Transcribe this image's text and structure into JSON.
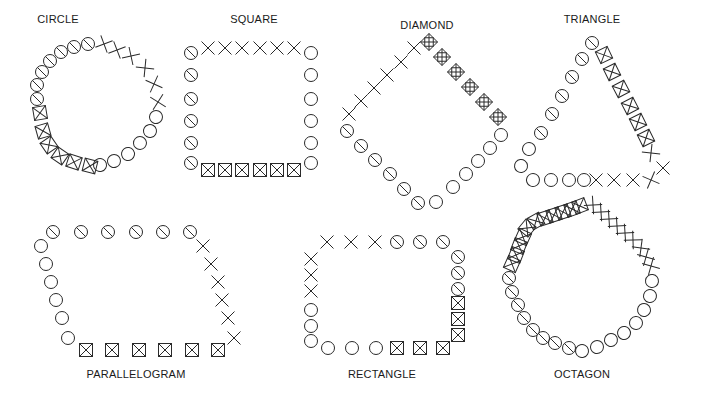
{
  "diagram": {
    "background": "#ffffff",
    "ink_color": "#2a2a2a",
    "symbol_legend": {
      "o": "open-circle",
      "s": "slashed-circle",
      "x": "x-cross",
      "b": "boxed-x",
      "d": "diamond-boxed-plus"
    },
    "shapes": [
      {
        "id": "circle",
        "label": "CIRCLE",
        "label_pos": [
          58,
          21
        ],
        "segments": [
          {
            "symbol": "s",
            "points": [
              [
                37,
                99
              ],
              [
                37,
                85
              ],
              [
                42,
                72
              ],
              [
                50,
                61
              ],
              [
                61,
                52
              ],
              [
                74,
                47
              ],
              [
                88,
                44
              ]
            ]
          },
          {
            "symbol": "x",
            "points": [
              [
                104,
                44
              ],
              [
                117,
                50
              ],
              [
                131,
                56
              ],
              [
                145,
                68
              ],
              [
                154,
                84
              ],
              [
                158,
                102
              ]
            ]
          },
          {
            "symbol": "o",
            "points": [
              [
                156,
                117
              ],
              [
                150,
                131
              ],
              [
                140,
                143
              ],
              [
                128,
                154
              ],
              [
                114,
                161
              ],
              [
                100,
                165
              ]
            ]
          },
          {
            "symbol": "b",
            "points": [
              [
                90,
                166
              ],
              [
                74,
                162
              ],
              [
                60,
                156
              ],
              [
                49,
                145
              ],
              [
                43,
                131
              ],
              [
                40,
                113
              ]
            ]
          }
        ]
      },
      {
        "id": "square",
        "label": "SQUARE",
        "label_pos": [
          254,
          21
        ],
        "segments": [
          {
            "symbol": "s",
            "points": [
              [
                191,
                53
              ],
              [
                191,
                75
              ],
              [
                191,
                99
              ],
              [
                191,
                121
              ],
              [
                191,
                143
              ],
              [
                191,
                163
              ]
            ]
          },
          {
            "symbol": "x",
            "points": [
              [
                208,
                48
              ],
              [
                225,
                48
              ],
              [
                242,
                48
              ],
              [
                260,
                48
              ],
              [
                277,
                48
              ],
              [
                294,
                48
              ]
            ]
          },
          {
            "symbol": "o",
            "points": [
              [
                311,
                53
              ],
              [
                311,
                75
              ],
              [
                311,
                99
              ],
              [
                311,
                121
              ],
              [
                311,
                143
              ],
              [
                311,
                163
              ]
            ]
          },
          {
            "symbol": "b",
            "points": [
              [
                208,
                170
              ],
              [
                225,
                170
              ],
              [
                242,
                170
              ],
              [
                260,
                170
              ],
              [
                277,
                170
              ],
              [
                294,
                170
              ]
            ]
          }
        ]
      },
      {
        "id": "diamond",
        "label": "DIAMOND",
        "label_pos": [
          427,
          27
        ],
        "segments": [
          {
            "symbol": "x",
            "points": [
              [
                349,
                114
              ],
              [
                361,
                101
              ],
              [
                374,
                88
              ],
              [
                387,
                75
              ],
              [
                401,
                62
              ],
              [
                414,
                48
              ]
            ]
          },
          {
            "symbol": "d",
            "points": [
              [
                429,
                42
              ],
              [
                442,
                57
              ],
              [
                456,
                72
              ],
              [
                470,
                87
              ],
              [
                484,
                102
              ],
              [
                498,
                117
              ]
            ]
          },
          {
            "symbol": "o",
            "points": [
              [
                501,
                135
              ],
              [
                490,
                148
              ],
              [
                478,
                161
              ],
              [
                466,
                174
              ],
              [
                453,
                187
              ],
              [
                436,
                202
              ]
            ]
          },
          {
            "symbol": "s",
            "points": [
              [
                347,
                131
              ],
              [
                361,
                146
              ],
              [
                375,
                160
              ],
              [
                390,
                174
              ],
              [
                404,
                189
              ],
              [
                418,
                203
              ]
            ]
          }
        ]
      },
      {
        "id": "triangle",
        "label": "TRIANGLE",
        "label_pos": [
          592,
          21
        ],
        "segments": [
          {
            "symbol": "s",
            "points": [
              [
                592,
                43
              ],
              [
                582,
                59
              ],
              [
                572,
                77
              ],
              [
                562,
                96
              ],
              [
                552,
                114
              ],
              [
                541,
                133
              ]
            ]
          },
          {
            "symbol": "b",
            "points": [
              [
                604,
                55
              ],
              [
                612,
                72
              ],
              [
                621,
                89
              ],
              [
                630,
                106
              ],
              [
                638,
                122
              ],
              [
                646,
                138
              ]
            ]
          },
          {
            "symbol": "x",
            "points": [
              [
                651,
                153
              ],
              [
                663,
                168
              ],
              [
                651,
                180
              ],
              [
                633,
                180
              ],
              [
                614,
                180
              ],
              [
                596,
                180
              ]
            ]
          },
          {
            "symbol": "o",
            "points": [
              [
                529,
                149
              ],
              [
                521,
                166
              ],
              [
                533,
                180
              ],
              [
                551,
                180
              ],
              [
                569,
                180
              ],
              [
                584,
                180
              ]
            ]
          }
        ]
      },
      {
        "id": "parallelogram",
        "label": "PARALLELOGRAM",
        "label_pos": [
          136,
          376
        ],
        "segments": [
          {
            "symbol": "s",
            "points": [
              [
                53,
                232
              ],
              [
                81,
                232
              ],
              [
                108,
                232
              ],
              [
                136,
                232
              ],
              [
                163,
                232
              ],
              [
                190,
                232
              ]
            ]
          },
          {
            "symbol": "o",
            "points": [
              [
                41,
                246
              ],
              [
                46,
                264
              ],
              [
                51,
                282
              ],
              [
                56,
                300
              ],
              [
                62,
                318
              ],
              [
                68,
                338
              ]
            ]
          },
          {
            "symbol": "x",
            "points": [
              [
                203,
                246
              ],
              [
                211,
                264
              ],
              [
                218,
                282
              ],
              [
                222,
                300
              ],
              [
                228,
                318
              ],
              [
                234,
                338
              ]
            ]
          },
          {
            "symbol": "b",
            "points": [
              [
                86,
                350
              ],
              [
                112,
                350
              ],
              [
                139,
                350
              ],
              [
                165,
                350
              ],
              [
                192,
                350
              ],
              [
                218,
                350
              ]
            ]
          }
        ]
      },
      {
        "id": "rectangle",
        "label": "RECTANGLE",
        "label_pos": [
          382,
          376
        ],
        "segments": [
          {
            "symbol": "x",
            "points": [
              [
                327,
                242
              ],
              [
                351,
                242
              ],
              [
                375,
                242
              ]
            ]
          },
          {
            "symbol": "s",
            "points": [
              [
                397,
                242
              ],
              [
                420,
                242
              ],
              [
                443,
                242
              ],
              [
                458,
                257
              ],
              [
                458,
                273
              ],
              [
                458,
                289
              ]
            ]
          },
          {
            "symbol": "x",
            "points": [
              [
                311,
                259
              ],
              [
                311,
                275
              ],
              [
                311,
                291
              ]
            ]
          },
          {
            "symbol": "o",
            "points": [
              [
                311,
                310
              ],
              [
                311,
                326
              ],
              [
                311,
                341
              ],
              [
                328,
                348
              ],
              [
                352,
                348
              ],
              [
                376,
                348
              ]
            ]
          },
          {
            "symbol": "b",
            "points": [
              [
                397,
                348
              ],
              [
                420,
                348
              ],
              [
                443,
                348
              ],
              [
                458,
                335
              ],
              [
                458,
                319
              ],
              [
                458,
                303
              ]
            ]
          }
        ]
      },
      {
        "id": "octagon",
        "label": "OCTAGON",
        "label_pos": [
          582,
          376
        ],
        "segments": [
          {
            "symbol": "b",
            "points": [
              [
                512,
                264
              ],
              [
                516,
                255
              ],
              [
                519,
                246
              ],
              [
                523,
                237
              ],
              [
                527,
                228
              ],
              [
                536,
                221
              ],
              [
                545,
                218
              ],
              [
                554,
                215
              ],
              [
                563,
                212
              ],
              [
                572,
                209
              ],
              [
                580,
                206
              ]
            ]
          },
          {
            "symbol": "x",
            "points": [
              [
                593,
                205
              ],
              [
                601,
                212
              ],
              [
                609,
                219
              ],
              [
                617,
                226
              ],
              [
                625,
                233
              ],
              [
                633,
                240
              ],
              [
                641,
                248
              ],
              [
                646,
                257
              ],
              [
                651,
                266
              ]
            ]
          },
          {
            "symbol": "s",
            "points": [
              [
                509,
                278
              ],
              [
                512,
                292
              ],
              [
                518,
                305
              ],
              [
                524,
                318
              ],
              [
                533,
                330
              ],
              [
                543,
                338
              ],
              [
                555,
                343
              ],
              [
                569,
                348
              ]
            ]
          },
          {
            "symbol": "o",
            "points": [
              [
                582,
                351
              ],
              [
                597,
                347
              ],
              [
                611,
                340
              ],
              [
                624,
                333
              ],
              [
                636,
                323
              ],
              [
                644,
                310
              ],
              [
                650,
                296
              ],
              [
                652,
                281
              ]
            ]
          }
        ]
      }
    ]
  }
}
